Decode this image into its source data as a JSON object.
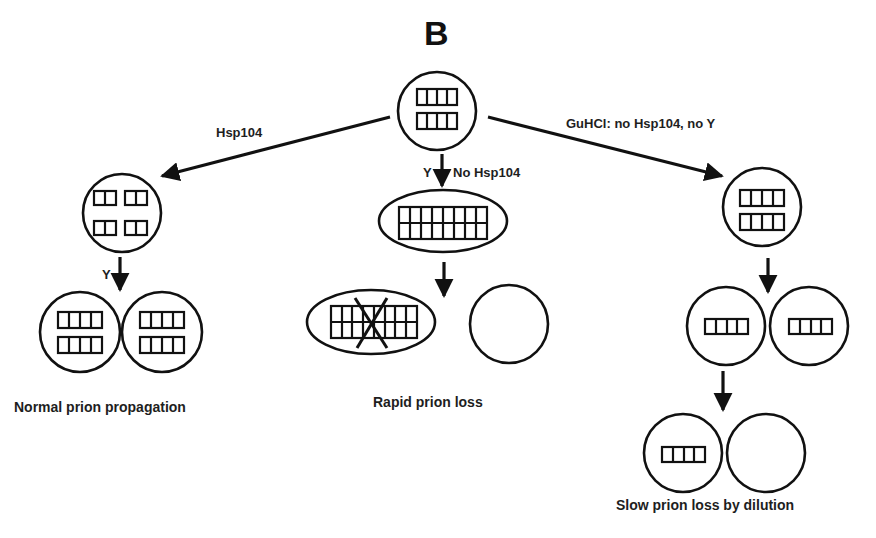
{
  "figure": {
    "panel_letter": "B",
    "colors": {
      "stroke": "#111111",
      "text": "#1e1e1e",
      "background": "#ffffff"
    }
  },
  "branches": {
    "left": {
      "arrow_label": "Hsp104",
      "step_label": "Y",
      "caption": "Normal prion propagation"
    },
    "middle": {
      "arrow_label_y": "Y",
      "arrow_label": "No Hsp104",
      "caption": "Rapid prion loss"
    },
    "right": {
      "arrow_label": "GuHCl: no Hsp104, no Y",
      "caption": "Slow prion loss by dilution"
    }
  },
  "cells": {
    "top": {
      "shape": "circle",
      "aggregates": "2 rows x 4 units"
    },
    "left_mid": {
      "shape": "circle",
      "aggregates": "4 blocks x 2 units"
    },
    "left_daughters": [
      {
        "aggregates": "2 rows x 4 units"
      },
      {
        "aggregates": "2 rows x 4 units"
      }
    ],
    "middle_mid": {
      "shape": "ellipse",
      "aggregates": "2 rows x 8 units"
    },
    "middle_daughters": [
      {
        "shape": "ellipse",
        "aggregates": "2 rows x 8 units, crossed out"
      },
      {
        "shape": "circle",
        "aggregates": "none"
      }
    ],
    "right_mid": {
      "shape": "circle",
      "aggregates": "2 rows x 4 units"
    },
    "right_daughters": [
      {
        "aggregates": "1 row x 4 units"
      },
      {
        "aggregates": "1 row x 4 units"
      }
    ],
    "right_granddaughters": [
      {
        "aggregates": "1 row x 4 units"
      },
      {
        "aggregates": "none"
      }
    ]
  }
}
